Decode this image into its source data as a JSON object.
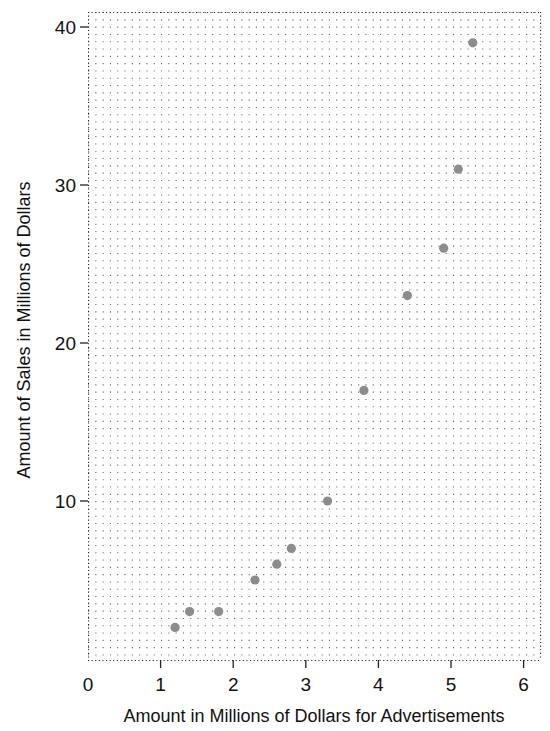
{
  "chart_data": {
    "type": "scatter",
    "title": "",
    "xlabel": "Amount in Millions of Dollars for Advertisements",
    "ylabel": "Amount of Sales in Millions of Dollars",
    "xlim": [
      0,
      6.2
    ],
    "ylim": [
      0,
      41
    ],
    "x_ticks": [
      0,
      1,
      2,
      3,
      4,
      5,
      6
    ],
    "y_ticks": [
      10,
      20,
      30,
      40
    ],
    "grid": "dotted",
    "legend": null,
    "point_color": "#8c8c8c",
    "series": [
      {
        "name": "Sales vs Advertising",
        "points": [
          {
            "x": 1.2,
            "y": 2
          },
          {
            "x": 1.4,
            "y": 3
          },
          {
            "x": 1.8,
            "y": 3
          },
          {
            "x": 2.3,
            "y": 5
          },
          {
            "x": 2.6,
            "y": 6
          },
          {
            "x": 2.8,
            "y": 7
          },
          {
            "x": 3.3,
            "y": 10
          },
          {
            "x": 3.8,
            "y": 17
          },
          {
            "x": 4.4,
            "y": 23
          },
          {
            "x": 4.9,
            "y": 26
          },
          {
            "x": 5.1,
            "y": 31
          },
          {
            "x": 5.3,
            "y": 39
          }
        ]
      }
    ]
  },
  "labels": {
    "x_axis_title": "Amount in Millions of Dollars for Advertisements",
    "y_axis_title": "Amount of Sales in Millions of Dollars"
  }
}
